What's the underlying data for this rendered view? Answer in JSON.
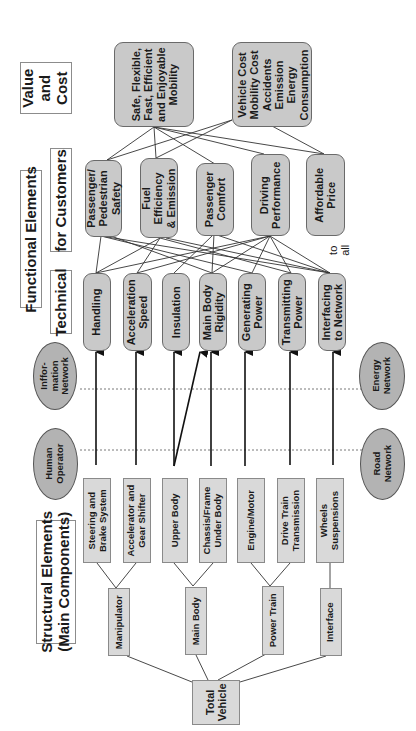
{
  "headers": {
    "value_cost": "Value\nand\nCost",
    "functional_elements": "Functional Elements",
    "for_customers": "for Customers",
    "technical": "Technical",
    "structural_elements": "Structural Elements\n(Main Components)"
  },
  "value_boxes": [
    {
      "id": "v1",
      "label": "Safe, Flexible,\nFast, Efficient\nand Enjoyable\nMobility"
    },
    {
      "id": "v2",
      "label": "Vehicle Cost\nMobility Cost\nAccidents\nEmission\nEnergy\nConsumption"
    }
  ],
  "customer_functions": [
    {
      "id": "c1",
      "label": "Passenger/\nPedestrian\nSafety"
    },
    {
      "id": "c2",
      "label": "Fuel\nEfficiency\n& Emission"
    },
    {
      "id": "c3",
      "label": "Passenger\nComfort"
    },
    {
      "id": "c4",
      "label": "Driving\nPerformance"
    },
    {
      "id": "c5",
      "label": "Affordable\nPrice"
    }
  ],
  "to_all_note": "to\nall",
  "technical_functions": [
    {
      "id": "t1",
      "label": "Handling"
    },
    {
      "id": "t2",
      "label": "Acceleration\nSpeed"
    },
    {
      "id": "t3",
      "label": "Insulation"
    },
    {
      "id": "t4",
      "label": "Main Body\nRigidity"
    },
    {
      "id": "t5",
      "label": "Generating\nPower"
    },
    {
      "id": "t6",
      "label": "Transmitting\nPower"
    },
    {
      "id": "t7",
      "label": "Interfacing\nto Network"
    }
  ],
  "networks": [
    {
      "id": "n1",
      "label": "Inffor-\nmation\nNetwork"
    },
    {
      "id": "n2",
      "label": "Human\nOperator"
    },
    {
      "id": "n3",
      "label": "Energy\nNetwork"
    },
    {
      "id": "n4",
      "label": "Road\nNetwork"
    }
  ],
  "components": [
    {
      "id": "s1",
      "label": "Steering and\nBrake System"
    },
    {
      "id": "s2",
      "label": "Accelerator and\nGear Shifter"
    },
    {
      "id": "s3",
      "label": "Upper Body"
    },
    {
      "id": "s4",
      "label": "Chassis/Frame\nUnder Body"
    },
    {
      "id": "s5",
      "label": "Engine/Motor"
    },
    {
      "id": "s6",
      "label": "Drive Train\nTransmission"
    },
    {
      "id": "s7",
      "label": "Wheels\nSuspensions"
    }
  ],
  "subsystems": [
    {
      "id": "m1",
      "label": "Manipulator"
    },
    {
      "id": "m2",
      "label": "Main Body"
    },
    {
      "id": "m3",
      "label": "Power Train"
    },
    {
      "id": "m4",
      "label": "Interface"
    }
  ],
  "root": {
    "id": "root",
    "label": "Total\nVehicle"
  },
  "colors": {
    "rounded_fill": "#c9c9c9",
    "square_fill": "#d9d9d9",
    "ellipse_fill": "#b3b3b3",
    "line": "#333333"
  }
}
